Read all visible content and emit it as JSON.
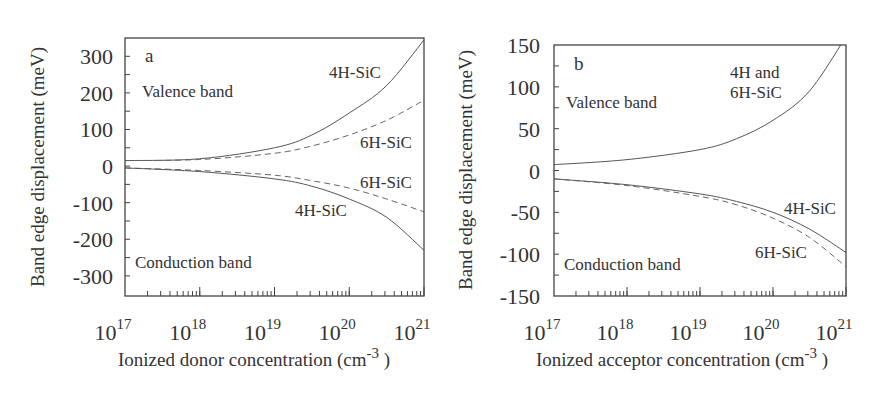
{
  "chart_data": [
    {
      "panel": "a",
      "type": "line",
      "xscale": "log",
      "xlabel": "Ionized donor concentration (cm-3)",
      "xlabel_main": "Ionized donor concentration (cm",
      "xlabel_sup": "-3",
      "xlabel_close": " )",
      "ylabel": "Band edge displacement (meV)",
      "xlim": [
        1e+17,
        1e+21
      ],
      "ylim": [
        -355,
        350
      ],
      "x_ticks": [
        {
          "base": "10",
          "exp": "17"
        },
        {
          "base": "10",
          "exp": "18"
        },
        {
          "base": "10",
          "exp": "19"
        },
        {
          "base": "10",
          "exp": "20"
        },
        {
          "base": "10",
          "exp": "21"
        }
      ],
      "y_ticks": [
        300,
        200,
        100,
        0,
        -100,
        -200,
        -300
      ],
      "y_tick_labels": [
        "300",
        "200",
        "100",
        "0",
        "-100",
        "-200",
        "-300"
      ],
      "grid": false,
      "annotations": {
        "panel_letter": "a",
        "valence": "Valence band",
        "conduction": "Conduction band",
        "vb_4h": "4H-SiC",
        "vb_6h": "6H-SiC",
        "cb_6h": "6H-SiC",
        "cb_4h": "4H-SiC"
      },
      "x_log10": [
        17,
        18,
        19,
        19.5,
        20,
        20.5,
        21
      ],
      "series": [
        {
          "name": "4H-SiC valence band",
          "style": "solid",
          "values": [
            15,
            20,
            50,
            85,
            145,
            220,
            345
          ]
        },
        {
          "name": "6H-SiC valence band",
          "style": "dashed",
          "values": [
            15,
            18,
            35,
            55,
            85,
            125,
            180
          ]
        },
        {
          "name": "6H-SiC conduction band",
          "style": "dashed",
          "values": [
            -5,
            -12,
            -25,
            -40,
            -60,
            -90,
            -125
          ]
        },
        {
          "name": "4H-SiC conduction band",
          "style": "solid",
          "values": [
            -5,
            -15,
            -35,
            -55,
            -90,
            -140,
            -230
          ]
        }
      ]
    },
    {
      "panel": "b",
      "type": "line",
      "xscale": "log",
      "xlabel": "Ionized acceptor concentration (cm-3)",
      "xlabel_main": "Ionized acceptor concentration (cm",
      "xlabel_sup": "-3",
      "xlabel_close": " )",
      "ylabel": "Band edge displacement (meV)",
      "xlim": [
        1e+17,
        1e+21
      ],
      "ylim": [
        -150,
        150
      ],
      "x_ticks": [
        {
          "base": "10",
          "exp": "17"
        },
        {
          "base": "10",
          "exp": "18"
        },
        {
          "base": "10",
          "exp": "19"
        },
        {
          "base": "10",
          "exp": "20"
        },
        {
          "base": "10",
          "exp": "21"
        }
      ],
      "y_ticks": [
        150,
        100,
        50,
        0,
        -50,
        -100,
        -150
      ],
      "y_tick_labels": [
        "150",
        "100",
        "50",
        "0",
        "-50",
        "-100",
        "-150"
      ],
      "grid": false,
      "annotations": {
        "panel_letter": "b",
        "valence": "Valence band",
        "conduction": "Conduction band",
        "vb_line1": "4H and",
        "vb_line2": "6H-SiC",
        "cb_4h": "4H-SiC",
        "cb_6h": "6H-SiC"
      },
      "x_log10": [
        17,
        18,
        19,
        19.5,
        20,
        20.5,
        21
      ],
      "series": [
        {
          "name": "4H and 6H-SiC valence band",
          "style": "solid",
          "values": [
            7,
            13,
            25,
            38,
            60,
            95,
            160
          ]
        },
        {
          "name": "4H-SiC conduction band",
          "style": "solid",
          "values": [
            -10,
            -17,
            -28,
            -37,
            -50,
            -70,
            -98
          ]
        },
        {
          "name": "6H-SiC conduction band",
          "style": "dashed",
          "values": [
            -10,
            -18,
            -31,
            -41,
            -57,
            -80,
            -115
          ]
        }
      ]
    }
  ]
}
